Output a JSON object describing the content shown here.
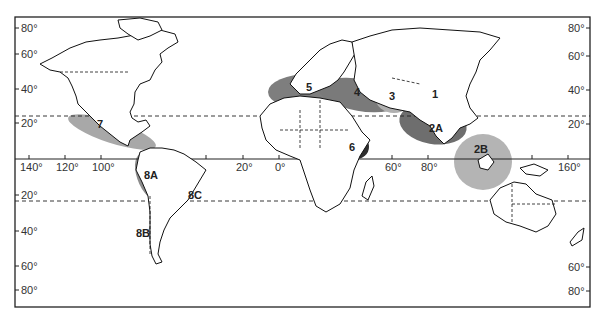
{
  "map": {
    "type": "world-map",
    "lat_labels_left": [
      "80°",
      "60°",
      "40°",
      "20°",
      "20°",
      "40°",
      "60°",
      "80°"
    ],
    "lat_labels_right": [
      "80°",
      "60°",
      "40°",
      "20°",
      "60°",
      "80°"
    ],
    "lon_labels": [
      "140°",
      "120°",
      "100°",
      "20°",
      "0°",
      "60°",
      "80°",
      "160°"
    ],
    "reference_lines": {
      "equator": "solid",
      "tropic_of_cancer": "dashed",
      "tropic_of_capricorn": "dashed"
    },
    "zones": [
      {
        "id": "1",
        "label": "1",
        "shade": "#c8c8c8"
      },
      {
        "id": "2A",
        "label": "2A",
        "shade": "#6e6e6e"
      },
      {
        "id": "2B",
        "label": "2B",
        "shade": "#b4b4b4"
      },
      {
        "id": "3",
        "label": "3",
        "shade": "#b0b0b0"
      },
      {
        "id": "4",
        "label": "4",
        "shade": "#7a7a7a"
      },
      {
        "id": "5",
        "label": "5",
        "shade": "#7e7e7e"
      },
      {
        "id": "6",
        "label": "6",
        "shade": "#2e2e2e"
      },
      {
        "id": "7",
        "label": "7",
        "shade": "#a8a8a8"
      },
      {
        "id": "8A",
        "label": "8A",
        "shade": "#8c8c8c"
      },
      {
        "id": "8B",
        "label": "8B",
        "shade": "#b8b8b8"
      },
      {
        "id": "8C",
        "label": "8C",
        "shade": "#b8b8b8"
      }
    ]
  }
}
